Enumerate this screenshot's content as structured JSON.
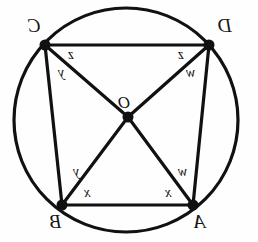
{
  "figure": {
    "type": "geometry-diagram",
    "width": 258,
    "height": 242,
    "stroke_color": "#111111",
    "background_color": "#fefefe",
    "text_orientation": "mirrored"
  },
  "circle": {
    "name": "circumcircle",
    "cx": 126,
    "cy": 120,
    "r": 112,
    "stroke_width": 3.2
  },
  "centre": {
    "label": "O",
    "x": 128,
    "y": 117,
    "label_x": 118,
    "label_y": 94
  },
  "vertices": [
    {
      "id": "C",
      "label": "C",
      "x": 45,
      "y": 45,
      "label_x": 28,
      "label_y": 16
    },
    {
      "id": "D",
      "label": "D",
      "x": 209,
      "y": 45,
      "label_x": 218,
      "label_y": 16
    },
    {
      "id": "B",
      "label": "B",
      "x": 62,
      "y": 205,
      "label_x": 50,
      "label_y": 212
    },
    {
      "id": "A",
      "label": "A",
      "x": 193,
      "y": 205,
      "label_x": 194,
      "label_y": 212
    }
  ],
  "segments": [
    {
      "name": "chord-CD",
      "from": "C",
      "to": "D",
      "stroke_width": 3.2
    },
    {
      "name": "chord-BA",
      "from": "B",
      "to": "A",
      "stroke_width": 3.2
    },
    {
      "name": "chord-CB",
      "from": "C",
      "to": "B",
      "stroke_width": 3.2
    },
    {
      "name": "chord-DA",
      "from": "D",
      "to": "A",
      "stroke_width": 3.2
    },
    {
      "name": "radius-CO",
      "from": "C",
      "to": "O",
      "stroke_width": 3.2
    },
    {
      "name": "radius-DO",
      "from": "D",
      "to": "O",
      "stroke_width": 3.2
    },
    {
      "name": "radius-BO",
      "from": "B",
      "to": "O",
      "stroke_width": 3.2
    },
    {
      "name": "radius-AO",
      "from": "A",
      "to": "O",
      "stroke_width": 3.2
    }
  ],
  "angle_labels": [
    {
      "id": "z-at-C",
      "label": "z",
      "at_vertex": "C",
      "x": 68,
      "y": 48
    },
    {
      "id": "y-at-C",
      "label": "y",
      "at_vertex": "C",
      "x": 58,
      "y": 66
    },
    {
      "id": "z-at-D",
      "label": "z",
      "at_vertex": "D",
      "x": 178,
      "y": 48
    },
    {
      "id": "w-at-D",
      "label": "w",
      "at_vertex": "D",
      "x": 186,
      "y": 66
    },
    {
      "id": "y-at-B",
      "label": "y",
      "at_vertex": "B",
      "x": 73,
      "y": 165
    },
    {
      "id": "x-at-B",
      "label": "x",
      "at_vertex": "B",
      "x": 84,
      "y": 186
    },
    {
      "id": "w-at-A",
      "label": "w",
      "at_vertex": "A",
      "x": 178,
      "y": 165
    },
    {
      "id": "x-at-A",
      "label": "x",
      "at_vertex": "A",
      "x": 165,
      "y": 186
    }
  ]
}
